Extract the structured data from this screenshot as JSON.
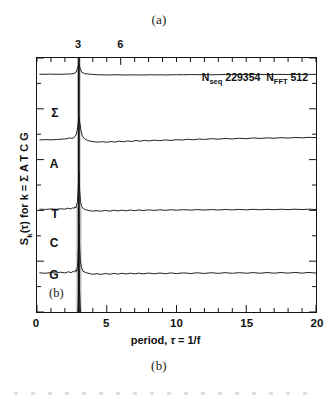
{
  "figure": {
    "panel_letter_top": "(a)",
    "panel_letter_bottom": "(b)",
    "panel_letter_inplot": "(b)"
  },
  "annotation": {
    "n_seq_symbol": "N",
    "n_seq_sub": "seq",
    "n_seq_value": "229354",
    "n_fft_symbol": "N",
    "n_fft_sub": "FFT",
    "n_fft_value": "512"
  },
  "axes": {
    "x_title_prefix": "period, ",
    "x_title_symbol": "τ",
    "x_title_suffix": " = 1/f",
    "y_title_prefix": "S",
    "y_title_sub": "k",
    "y_title_suffix": "(τ) for k = Σ A T C G",
    "top_tick_labels": [
      "3",
      "6"
    ],
    "bottom_tick_labels": [
      "0",
      "5",
      "10",
      "15",
      "20"
    ]
  },
  "traces": {
    "labels": [
      "Σ",
      "A",
      "T",
      "C",
      "G"
    ]
  },
  "colors": {
    "line": "#141414",
    "frame": "#141414",
    "background": "#ffffff"
  },
  "chart_data": {
    "type": "line",
    "title": "",
    "subtitle": "",
    "xlabel": "period, τ = 1/f",
    "ylabel": "S_k(τ) for k = Σ A T C G",
    "xlim": [
      0,
      20
    ],
    "ylim": [
      0,
      1
    ],
    "grid": false,
    "legend": "inline-left-labels",
    "top_axis": {
      "label": "",
      "tick_values": [
        3,
        6
      ],
      "tick_labels": [
        "3",
        "6"
      ],
      "note": "secondary top axis sharing the period scale; major ticks at 3 and 6"
    },
    "bottom_axis": {
      "tick_values": [
        0,
        5,
        10,
        15,
        20
      ],
      "tick_labels": [
        "0",
        "5",
        "10",
        "15",
        "20"
      ],
      "minor_tick_step": 1
    },
    "annotations": [
      {
        "text": "N_seq 229354",
        "x": 13.0,
        "y": 0.93
      },
      {
        "text": "N_FFT 512",
        "x": 17.2,
        "y": 0.93
      },
      {
        "text": "(b)",
        "x": 1.1,
        "y": 0.11
      }
    ],
    "peak": {
      "period": 3.0,
      "description": "dominant period-3 spike present in all five spectra"
    },
    "series": [
      {
        "name": "Σ",
        "label_x": 1.6,
        "baseline": 0.815,
        "spike_height": 0.185,
        "x": [
          0.2,
          0.5,
          0.9,
          1.3,
          1.7,
          2.1,
          2.4,
          2.65,
          2.8,
          2.9,
          3.0,
          3.1,
          3.2,
          3.4,
          3.7,
          4.0,
          4.4,
          4.8,
          5.2,
          5.6,
          6.0,
          6.4,
          6.8,
          7.2,
          7.6,
          8.0,
          8.4,
          8.8,
          9.2,
          9.6,
          10.0,
          10.5,
          11.0,
          11.5,
          12.0,
          12.5,
          13.0,
          13.5,
          14.0,
          14.5,
          15.0,
          15.5,
          16.0,
          16.5,
          17.0,
          17.5,
          18.0,
          18.5,
          19.0,
          19.5,
          20.0
        ],
        "y": [
          0.822,
          0.82,
          0.823,
          0.821,
          0.82,
          0.824,
          0.826,
          0.833,
          0.858,
          0.92,
          1.0,
          0.92,
          0.858,
          0.833,
          0.824,
          0.818,
          0.812,
          0.81,
          0.809,
          0.812,
          0.81,
          0.808,
          0.811,
          0.809,
          0.808,
          0.812,
          0.81,
          0.812,
          0.809,
          0.811,
          0.814,
          0.812,
          0.816,
          0.813,
          0.815,
          0.812,
          0.814,
          0.818,
          0.815,
          0.817,
          0.814,
          0.816,
          0.818,
          0.815,
          0.817,
          0.819,
          0.816,
          0.818,
          0.817,
          0.819,
          0.818
        ]
      },
      {
        "name": "A",
        "label_x": 1.6,
        "baseline": 0.63,
        "spike_height": 0.37,
        "x": [
          0.2,
          0.6,
          1.0,
          1.4,
          1.8,
          2.1,
          2.35,
          2.5,
          2.62,
          2.72,
          2.8,
          2.88,
          2.95,
          3.0,
          3.08,
          3.15,
          3.25,
          3.4,
          3.6,
          3.85,
          4.1,
          4.4,
          4.7,
          5.0,
          5.3,
          5.6,
          5.9,
          6.2,
          6.5,
          6.8,
          7.1,
          7.4,
          7.7,
          8.0,
          8.4,
          8.8,
          9.2,
          9.6,
          10.0,
          10.4,
          10.8,
          11.2,
          11.6,
          12.0,
          12.5,
          13.0,
          13.5,
          14.0,
          14.5,
          15.0,
          15.5,
          16.0,
          16.5,
          17.0,
          17.5,
          18.0,
          18.5,
          19.0,
          19.5,
          20.0
        ],
        "y": [
          0.636,
          0.641,
          0.637,
          0.643,
          0.648,
          0.655,
          0.668,
          0.66,
          0.672,
          0.69,
          0.72,
          0.79,
          0.9,
          1.0,
          0.9,
          0.79,
          0.7,
          0.655,
          0.63,
          0.614,
          0.606,
          0.6,
          0.608,
          0.598,
          0.61,
          0.601,
          0.616,
          0.606,
          0.62,
          0.611,
          0.626,
          0.614,
          0.63,
          0.62,
          0.632,
          0.624,
          0.636,
          0.628,
          0.64,
          0.634,
          0.646,
          0.638,
          0.65,
          0.644,
          0.656,
          0.648,
          0.66,
          0.652,
          0.663,
          0.656,
          0.668,
          0.66,
          0.67,
          0.663,
          0.673,
          0.666,
          0.676,
          0.67,
          0.678,
          0.674
        ]
      },
      {
        "name": "T",
        "label_x": 1.6,
        "baseline": 0.44,
        "spike_height": 0.56,
        "x": [
          0.2,
          0.6,
          1.0,
          1.4,
          1.7,
          2.0,
          2.2,
          2.4,
          2.55,
          2.65,
          2.72,
          2.78,
          2.84,
          2.9,
          2.95,
          3.0,
          3.06,
          3.12,
          3.2,
          3.32,
          3.5,
          3.75,
          4.0,
          4.3,
          4.6,
          4.9,
          5.2,
          5.5,
          5.8,
          6.1,
          6.4,
          6.7,
          7.0,
          7.3,
          7.6,
          8.0,
          8.4,
          8.8,
          9.2,
          9.6,
          10.0,
          10.5,
          11.0,
          11.5,
          12.0,
          12.5,
          13.0,
          13.5,
          14.0,
          14.5,
          15.0,
          15.5,
          16.0,
          16.5,
          17.0,
          17.5,
          18.0,
          18.5,
          19.0,
          19.5,
          20.0
        ],
        "y": [
          0.452,
          0.448,
          0.455,
          0.45,
          0.458,
          0.452,
          0.466,
          0.456,
          0.472,
          0.462,
          0.486,
          0.47,
          0.51,
          0.56,
          0.7,
          1.0,
          0.72,
          0.56,
          0.49,
          0.46,
          0.444,
          0.43,
          0.424,
          0.431,
          0.422,
          0.434,
          0.424,
          0.436,
          0.427,
          0.438,
          0.428,
          0.44,
          0.43,
          0.441,
          0.432,
          0.442,
          0.434,
          0.443,
          0.435,
          0.444,
          0.437,
          0.445,
          0.438,
          0.446,
          0.439,
          0.447,
          0.44,
          0.448,
          0.441,
          0.449,
          0.442,
          0.45,
          0.443,
          0.45,
          0.444,
          0.451,
          0.445,
          0.452,
          0.446,
          0.452,
          0.447
        ]
      },
      {
        "name": "C",
        "label_x": 1.6,
        "baseline": 0.265,
        "spike_height": 0.735,
        "x": [
          0.2,
          0.6,
          1.0,
          1.4,
          1.7,
          2.0,
          2.25,
          2.45,
          2.6,
          2.7,
          2.78,
          2.84,
          2.89,
          2.93,
          2.97,
          3.0,
          3.05,
          3.1,
          3.18,
          3.3,
          3.5,
          3.75,
          4.0,
          4.3,
          4.6,
          4.9,
          5.2,
          5.5,
          5.8,
          6.1,
          6.4,
          6.7,
          7.0,
          7.3,
          7.6,
          8.0,
          8.4,
          8.8,
          9.2,
          9.6,
          10.0,
          10.5,
          11.0,
          11.5,
          12.0,
          12.5,
          13.0,
          13.5,
          14.0,
          14.5,
          15.0,
          15.5,
          16.0,
          16.5,
          17.0,
          17.5,
          18.0,
          18.5,
          19.0,
          19.5,
          20.0
        ],
        "y": [
          0.278,
          0.272,
          0.282,
          0.274,
          0.288,
          0.276,
          0.294,
          0.28,
          0.302,
          0.288,
          0.32,
          0.3,
          0.36,
          0.44,
          0.65,
          1.0,
          0.68,
          0.47,
          0.36,
          0.3,
          0.282,
          0.268,
          0.258,
          0.266,
          0.256,
          0.268,
          0.258,
          0.27,
          0.26,
          0.272,
          0.262,
          0.273,
          0.263,
          0.274,
          0.264,
          0.275,
          0.265,
          0.276,
          0.266,
          0.277,
          0.267,
          0.278,
          0.268,
          0.279,
          0.269,
          0.28,
          0.27,
          0.281,
          0.271,
          0.281,
          0.272,
          0.282,
          0.272,
          0.283,
          0.273,
          0.283,
          0.274,
          0.284,
          0.274,
          0.284,
          0.275
        ]
      },
      {
        "name": "G",
        "label_x": 1.6,
        "baseline": 0.08,
        "spike_height": 0.92,
        "x": [
          0.2,
          0.6,
          1.0,
          1.4,
          1.7,
          2.0,
          2.25,
          2.45,
          2.6,
          2.7,
          2.8,
          2.88,
          2.94,
          2.98,
          3.0,
          3.04,
          3.1,
          3.18,
          3.3,
          3.45,
          3.65,
          3.9,
          4.2,
          4.5,
          4.8,
          5.1,
          5.4,
          5.7,
          6.0,
          6.3,
          6.6,
          6.9,
          7.2,
          7.5,
          7.8,
          8.1,
          8.5,
          8.9,
          9.3,
          9.7,
          10.1,
          10.5,
          11.0,
          11.5,
          12.0,
          12.5,
          13.0,
          13.5,
          14.0,
          14.5,
          15.0,
          15.5,
          16.0,
          16.5,
          17.0,
          17.5,
          18.0,
          18.5,
          19.0,
          19.5,
          20.0
        ],
        "y": [
          0.098,
          0.09,
          0.104,
          0.092,
          0.11,
          0.094,
          0.116,
          0.098,
          0.124,
          0.104,
          0.14,
          0.2,
          0.38,
          0.7,
          1.0,
          0.72,
          0.42,
          0.23,
          0.15,
          0.118,
          0.1,
          0.088,
          0.082,
          0.092,
          0.08,
          0.094,
          0.082,
          0.096,
          0.084,
          0.097,
          0.085,
          0.098,
          0.086,
          0.099,
          0.087,
          0.1,
          0.088,
          0.101,
          0.089,
          0.102,
          0.09,
          0.103,
          0.091,
          0.104,
          0.092,
          0.104,
          0.093,
          0.105,
          0.094,
          0.105,
          0.095,
          0.106,
          0.096,
          0.106,
          0.097,
          0.107,
          0.098,
          0.107,
          0.099,
          0.108,
          0.1
        ]
      }
    ]
  }
}
